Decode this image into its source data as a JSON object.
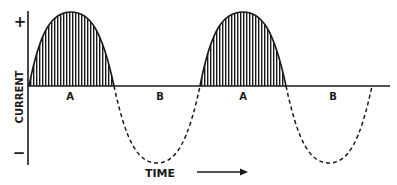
{
  "diagram": {
    "axis": {
      "y_label": "CURRENT",
      "y_positive": "+",
      "y_negative": "−",
      "x_label": "TIME"
    },
    "half_cycles": [
      {
        "label": "A",
        "style": "solid-shaded",
        "polarity": "positive"
      },
      {
        "label": "B",
        "style": "dashed",
        "polarity": "negative"
      },
      {
        "label": "A",
        "style": "solid-shaded",
        "polarity": "positive"
      },
      {
        "label": "B",
        "style": "dashed",
        "polarity": "negative"
      }
    ],
    "colors": {
      "ink": "#1a1a1a",
      "background": "#ffffff"
    }
  }
}
